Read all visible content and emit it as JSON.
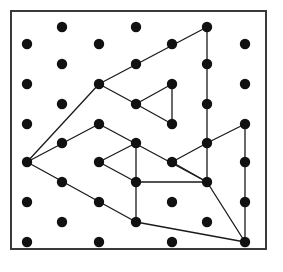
{
  "figure": {
    "kind": "geoboard-dot-grid-diagram",
    "title": "",
    "caption": "",
    "background_color": "#ffffff",
    "frame": {
      "name": "board-frame",
      "x": 11,
      "y": 11,
      "width": 255,
      "height": 238,
      "stroke_color": "#3a3a3a",
      "stroke_width": 2,
      "fill": "#ffffff"
    },
    "dots": {
      "radius": 5.2,
      "color": "#111111",
      "count": 38,
      "lattice": "staggered-triangular",
      "row_spacing": 23.8,
      "column_spacing": 72.5,
      "rows": [
        {
          "index": 0,
          "y": 27,
          "xs": [
            62,
            136,
            207
          ]
        },
        {
          "index": 1,
          "y": 44,
          "xs": [
            27,
            99,
            172,
            245
          ]
        },
        {
          "index": 2,
          "y": 64,
          "xs": [
            62,
            136,
            207
          ]
        },
        {
          "index": 3,
          "y": 84,
          "xs": [
            27,
            99,
            172,
            245
          ]
        },
        {
          "index": 4,
          "y": 104,
          "xs": [
            62,
            136,
            207
          ]
        },
        {
          "index": 5,
          "y": 124,
          "xs": [
            27,
            99,
            172,
            245
          ]
        },
        {
          "index": 6,
          "y": 143,
          "xs": [
            62,
            136,
            207
          ]
        },
        {
          "index": 7,
          "y": 162,
          "xs": [
            27,
            99,
            172,
            245
          ]
        },
        {
          "index": 8,
          "y": 182,
          "xs": [
            62,
            136,
            207
          ]
        },
        {
          "index": 9,
          "y": 202,
          "xs": [
            27,
            99,
            172,
            245
          ]
        },
        {
          "index": 10,
          "y": 222,
          "xs": [
            62,
            136,
            207
          ]
        },
        {
          "index": 11,
          "y": 242,
          "xs": [
            27,
            99,
            172,
            245
          ]
        }
      ]
    },
    "segments": {
      "color": "#1a1a1a",
      "width": 1.3,
      "lines": [
        {
          "name": "outer-upper-arm-a",
          "x1": 27,
          "y1": 162,
          "x2": 99,
          "y2": 84
        },
        {
          "name": "outer-upper-arm-b",
          "x1": 99,
          "y1": 84,
          "x2": 207,
          "y2": 27
        },
        {
          "name": "outer-right-vertical",
          "x1": 207,
          "y1": 27,
          "x2": 207,
          "y2": 182
        },
        {
          "name": "outer-lower-arm-a",
          "x1": 207,
          "y1": 182,
          "x2": 99,
          "y2": 124
        },
        {
          "name": "outer-lower-arm-b",
          "x1": 99,
          "y1": 124,
          "x2": 27,
          "y2": 162
        },
        {
          "name": "mid-upper-arm-a",
          "x1": 27,
          "y1": 162,
          "x2": 136,
          "y2": 222
        },
        {
          "name": "mid-upper-arm-b",
          "x1": 136,
          "y1": 222,
          "x2": 245,
          "y2": 242
        },
        {
          "name": "inner-top-left-arm-a",
          "x1": 99,
          "y1": 84,
          "x2": 136,
          "y2": 104
        },
        {
          "name": "inner-top-left-arm-b",
          "x1": 136,
          "y1": 104,
          "x2": 172,
          "y2": 84
        },
        {
          "name": "inner-top-left-vertical",
          "x1": 172,
          "y1": 84,
          "x2": 172,
          "y2": 124
        },
        {
          "name": "inner-top-left-arm-c",
          "x1": 172,
          "y1": 124,
          "x2": 136,
          "y2": 104
        },
        {
          "name": "inner-bottom-left-arm-a",
          "x1": 99,
          "y1": 162,
          "x2": 136,
          "y2": 143
        },
        {
          "name": "inner-bottom-left-vertical",
          "x1": 136,
          "y1": 143,
          "x2": 136,
          "y2": 222
        },
        {
          "name": "inner-bottom-left-arm-b",
          "x1": 99,
          "y1": 162,
          "x2": 136,
          "y2": 182
        },
        {
          "name": "inner-bottom-left-arm-c",
          "x1": 136,
          "y1": 182,
          "x2": 207,
          "y2": 182
        },
        {
          "name": "inner-bottom-right-arm-a",
          "x1": 172,
          "y1": 162,
          "x2": 207,
          "y2": 143
        },
        {
          "name": "inner-bottom-right-arm-b",
          "x1": 207,
          "y1": 143,
          "x2": 245,
          "y2": 124
        },
        {
          "name": "inner-bottom-right-vertical",
          "x1": 245,
          "y1": 124,
          "x2": 245,
          "y2": 242
        },
        {
          "name": "inner-bottom-right-arm-c",
          "x1": 172,
          "y1": 162,
          "x2": 207,
          "y2": 182
        },
        {
          "name": "inner-bottom-right-arm-d",
          "x1": 207,
          "y1": 182,
          "x2": 245,
          "y2": 242
        }
      ]
    }
  }
}
